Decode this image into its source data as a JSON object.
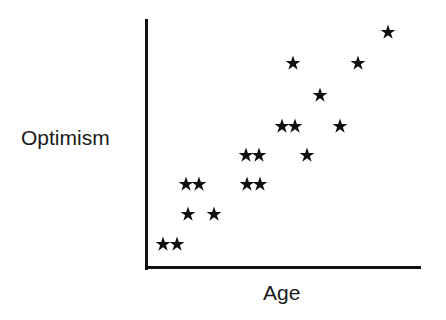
{
  "chart_data": {
    "type": "scatter",
    "title": "",
    "xlabel": "Age",
    "ylabel": "Optimism",
    "xlim": [
      0,
      100
    ],
    "ylim": [
      0,
      100
    ],
    "grid": false,
    "legend": null,
    "marker": "star",
    "marker_color": "#111111",
    "axis_color": "#111111",
    "background_color": "#ffffff",
    "points_px": [
      {
        "x": 163,
        "y": 244
      },
      {
        "x": 177,
        "y": 244
      },
      {
        "x": 188,
        "y": 214
      },
      {
        "x": 214,
        "y": 214
      },
      {
        "x": 186,
        "y": 184
      },
      {
        "x": 199,
        "y": 184
      },
      {
        "x": 247,
        "y": 184
      },
      {
        "x": 260,
        "y": 184
      },
      {
        "x": 246,
        "y": 155
      },
      {
        "x": 259,
        "y": 155
      },
      {
        "x": 307,
        "y": 155
      },
      {
        "x": 282,
        "y": 126
      },
      {
        "x": 295,
        "y": 126
      },
      {
        "x": 340,
        "y": 126
      },
      {
        "x": 320,
        "y": 95
      },
      {
        "x": 293,
        "y": 63
      },
      {
        "x": 358,
        "y": 63
      },
      {
        "x": 388,
        "y": 32
      }
    ],
    "x": [
      6.2,
      11.3,
      15.3,
      24.8,
      14.6,
      19.3,
      36.9,
      41.6,
      36.6,
      41.2,
      58.7,
      49.6,
      54.3,
      70.7,
      63.4,
      53.6,
      77.2,
      88.0
    ],
    "y": [
      9.3,
      9.3,
      21.4,
      21.4,
      33.5,
      33.5,
      33.5,
      33.5,
      45.2,
      45.2,
      45.2,
      56.9,
      56.9,
      56.9,
      69.4,
      82.3,
      82.3,
      94.8
    ],
    "n_points": 18
  },
  "axes": {
    "y_label": "Optimism",
    "x_label": "Age"
  }
}
